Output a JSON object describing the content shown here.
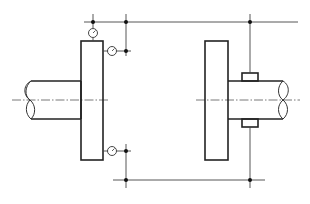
{
  "diagram": {
    "type": "technical-drawing",
    "colors": {
      "line": "#222222",
      "background": "#ffffff"
    },
    "components": [
      {
        "id": "left-shaft",
        "label": "Left shaft (broken end)"
      },
      {
        "id": "left-flange",
        "label": "Left coupling half / flange"
      },
      {
        "id": "right-flange",
        "label": "Right coupling half / flange"
      },
      {
        "id": "right-shaft",
        "label": "Right shaft (broken end)"
      },
      {
        "id": "clamp-top",
        "label": "Indicator bracket clamp (top)"
      },
      {
        "id": "clamp-bottom",
        "label": "Indicator bracket clamp (bottom)"
      },
      {
        "id": "gauge-axial-top",
        "label": "Dial indicator (radial, top)"
      },
      {
        "id": "gauge-face-top",
        "label": "Dial indicator (face, top)"
      },
      {
        "id": "gauge-face-bottom",
        "label": "Dial indicator (face, bottom)"
      },
      {
        "id": "bracket-top",
        "label": "Upper indicator bracket"
      },
      {
        "id": "bracket-bottom",
        "label": "Lower indicator bracket"
      },
      {
        "id": "centerline",
        "label": "Shaft axis centerline"
      }
    ]
  }
}
